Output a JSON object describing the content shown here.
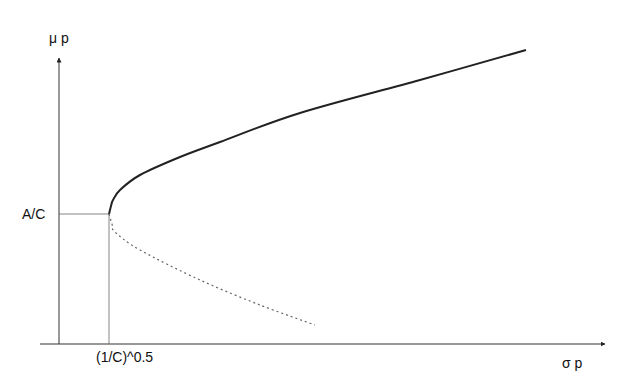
{
  "chart_data": {
    "type": "line",
    "title": "",
    "xlabel": "σp",
    "ylabel": "μp",
    "x_tick_labels": [
      "(1/C)^0.5"
    ],
    "y_tick_labels": [
      "A/C"
    ],
    "grid": false,
    "legend": null,
    "series": [
      {
        "name": "efficient frontier (upper branch)",
        "style": "solid",
        "points_px": [
          [
            109,
            214
          ],
          [
            111,
            206
          ],
          [
            113,
            200
          ],
          [
            120,
            190
          ],
          [
            140,
            175
          ],
          [
            180,
            157
          ],
          [
            220,
            142
          ],
          [
            300,
            113
          ],
          [
            420,
            80
          ],
          [
            526,
            50
          ]
        ]
      },
      {
        "name": "inefficient branch (lower)",
        "style": "dotted",
        "points_px": [
          [
            109,
            214
          ],
          [
            112,
            224
          ],
          [
            115,
            232
          ],
          [
            140,
            250
          ],
          [
            200,
            280
          ],
          [
            260,
            305
          ],
          [
            315,
            325
          ]
        ]
      }
    ],
    "annotations": [
      {
        "text": "A/C",
        "meaning": "mean at minimum-variance point"
      },
      {
        "text": "(1/C)^0.5",
        "meaning": "std dev at minimum-variance point"
      }
    ]
  },
  "labels": {
    "y_axis": "μ p",
    "x_axis": "σ p",
    "y_tick": "A/C",
    "x_tick": "(1/C)^0.5"
  }
}
